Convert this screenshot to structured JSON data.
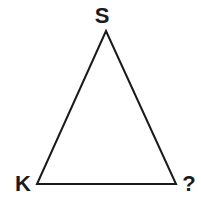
{
  "diagram": {
    "type": "triangle",
    "stroke_color": "#1a1a1a",
    "text_color": "#1a1a1a",
    "vertices": [
      {
        "id": "top",
        "label": "S",
        "x": 106,
        "y": 31,
        "label_x": 102,
        "label_y": 23
      },
      {
        "id": "bottom-left",
        "label": "K",
        "x": 37,
        "y": 184,
        "label_x": 23,
        "label_y": 191
      },
      {
        "id": "bottom-right",
        "label": "?",
        "x": 176,
        "y": 184,
        "label_x": 189,
        "label_y": 191
      }
    ]
  }
}
